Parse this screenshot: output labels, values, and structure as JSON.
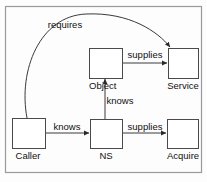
{
  "diagram": {
    "type": "node-edge-diagram",
    "frame": {
      "present": true,
      "color": "#9a9a9a"
    },
    "colors": {
      "background": "#fdfdfd",
      "node_stroke": "#4a4a4a",
      "node_fill": "#ffffff",
      "edge_stroke": "#3a3a3a",
      "text": "#111111",
      "frame": "#9a9a9a"
    },
    "nodes": [
      {
        "id": "caller",
        "label": "Caller",
        "x": 12,
        "y": 118,
        "w": 33,
        "h": 30,
        "label_x": 28,
        "label_y": 159,
        "label_anchor": "middle"
      },
      {
        "id": "ns",
        "label": "NS",
        "x": 90,
        "y": 119,
        "w": 32,
        "h": 29,
        "label_x": 106,
        "label_y": 159,
        "label_anchor": "middle"
      },
      {
        "id": "acquire",
        "label": "Acquire",
        "x": 167,
        "y": 119,
        "w": 31,
        "h": 29,
        "label_x": 183,
        "label_y": 159,
        "label_anchor": "middle"
      },
      {
        "id": "object",
        "label": "Object",
        "x": 89,
        "y": 48,
        "w": 33,
        "h": 30,
        "label_x": 89,
        "label_y": 89,
        "label_anchor": "start"
      },
      {
        "id": "service",
        "label": "Service",
        "x": 168,
        "y": 48,
        "w": 30,
        "h": 30,
        "label_x": 183,
        "label_y": 89,
        "label_anchor": "middle"
      }
    ],
    "edges": [
      {
        "id": "caller-requires-service",
        "from": "caller",
        "to": "service",
        "label": "requires",
        "label_x": 65,
        "label_y": 28,
        "label_anchor": "middle",
        "shape": "curve",
        "path": "M 27 118 C 18 70 40 16 86 14 C 130 12 158 32 170 47"
      },
      {
        "id": "caller-knows-ns",
        "from": "caller",
        "to": "ns",
        "label": "knows",
        "label_x": 67,
        "label_y": 130,
        "label_anchor": "middle",
        "shape": "line",
        "path": "M 45 133 L 89 133"
      },
      {
        "id": "ns-supplies-acquire",
        "from": "ns",
        "to": "acquire",
        "label": "supplies",
        "label_x": 145,
        "label_y": 130,
        "label_anchor": "middle",
        "shape": "line",
        "path": "M 122 133 L 166 133"
      },
      {
        "id": "ns-knows-object",
        "from": "ns",
        "to": "object",
        "label": "knows",
        "label_x": 120,
        "label_y": 104,
        "label_anchor": "middle",
        "shape": "line",
        "path": "M 105 119 L 105 79"
      },
      {
        "id": "object-supplies-service",
        "from": "object",
        "to": "service",
        "label": "supplies",
        "label_x": 145,
        "label_y": 58,
        "label_anchor": "middle",
        "shape": "line",
        "path": "M 122 63 L 167 63"
      }
    ]
  }
}
